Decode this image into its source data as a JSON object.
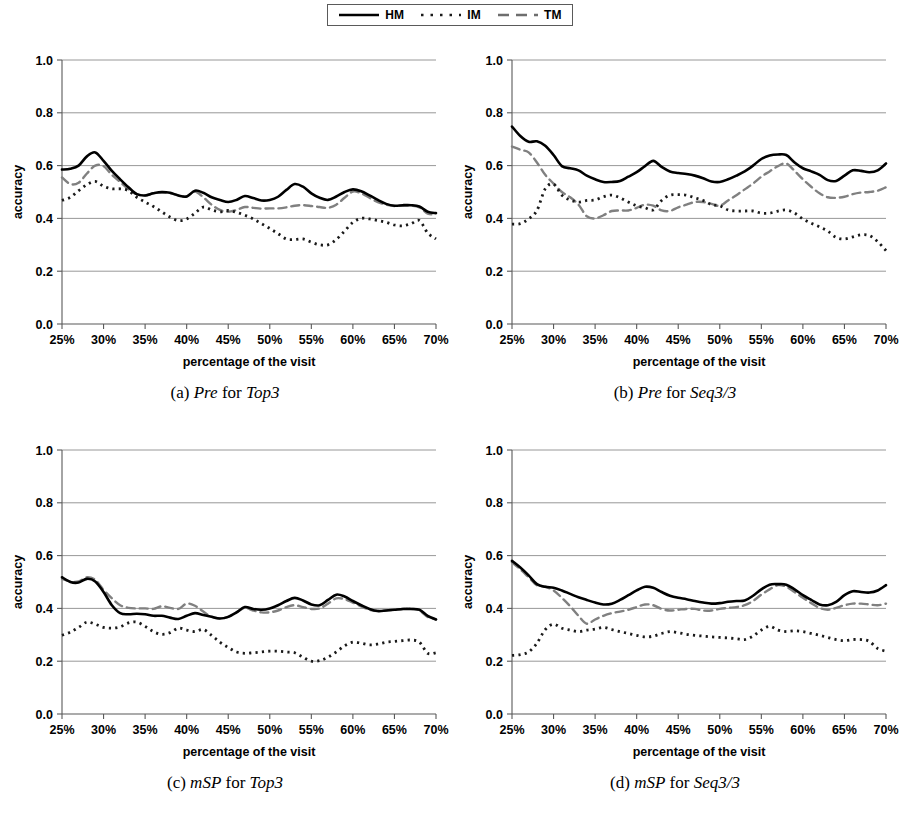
{
  "legend": {
    "entries": [
      {
        "label": "HM",
        "style": "solid"
      },
      {
        "label": "IM",
        "style": "dotted"
      },
      {
        "label": "TM",
        "style": "dashed"
      }
    ]
  },
  "colors": {
    "hm": "#000000",
    "im": "#1a1a1a",
    "tm": "#808080",
    "axis": "#595959",
    "grid": "#8c8c8c",
    "background": "#ffffff"
  },
  "axes": {
    "ylabel": "accuracy",
    "xlabel": "percentage of the visit",
    "yticks": [
      "0.0",
      "0.2",
      "0.4",
      "0.6",
      "0.8",
      "1.0"
    ],
    "xticks": [
      "25%",
      "30%",
      "35%",
      "40%",
      "45%",
      "50%",
      "55%",
      "60%",
      "65%",
      "70%"
    ],
    "ylim": [
      0.0,
      1.0
    ],
    "xlim": [
      25,
      70
    ],
    "grid": true,
    "legend_position": "top-center"
  },
  "captions": {
    "a": {
      "index": "(a)",
      "metric": "Pre",
      "joiner": "for",
      "dataset": "Top3"
    },
    "b": {
      "index": "(b)",
      "metric": "Pre",
      "joiner": "for",
      "dataset": "Seq3/3"
    },
    "c": {
      "index": "(c)",
      "metric": "mSP",
      "joiner": "for",
      "dataset": "Top3"
    },
    "d": {
      "index": "(d)",
      "metric": "mSP",
      "joiner": "for",
      "dataset": "Seq3/3"
    }
  },
  "chart_data": [
    {
      "id": "a",
      "type": "line",
      "title": "(a) Pre for Top3",
      "xlabel": "percentage of the visit",
      "ylabel": "accuracy",
      "xlim": [
        25,
        70
      ],
      "ylim": [
        0.0,
        1.0
      ],
      "grid": true,
      "legend": [
        "HM",
        "IM",
        "TM"
      ],
      "x": [
        25,
        26,
        27,
        28,
        29,
        30,
        31,
        32,
        33,
        34,
        35,
        36,
        37,
        38,
        39,
        40,
        41,
        42,
        43,
        44,
        45,
        46,
        47,
        48,
        49,
        50,
        51,
        52,
        53,
        54,
        55,
        56,
        57,
        58,
        59,
        60,
        61,
        62,
        63,
        64,
        65,
        66,
        67,
        68,
        69,
        70
      ],
      "series": [
        {
          "name": "HM",
          "style": "solid",
          "values": [
            0.585,
            0.588,
            0.6,
            0.635,
            0.65,
            0.618,
            0.58,
            0.548,
            0.518,
            0.492,
            0.487,
            0.495,
            0.5,
            0.497,
            0.487,
            0.483,
            0.505,
            0.497,
            0.48,
            0.47,
            0.462,
            0.47,
            0.485,
            0.477,
            0.468,
            0.47,
            0.482,
            0.508,
            0.53,
            0.52,
            0.495,
            0.478,
            0.47,
            0.483,
            0.5,
            0.51,
            0.503,
            0.487,
            0.47,
            0.455,
            0.448,
            0.45,
            0.45,
            0.445,
            0.425,
            0.42
          ]
        },
        {
          "name": "IM",
          "style": "dotted",
          "values": [
            0.468,
            0.48,
            0.505,
            0.528,
            0.54,
            0.522,
            0.512,
            0.512,
            0.505,
            0.48,
            0.462,
            0.445,
            0.425,
            0.405,
            0.392,
            0.398,
            0.42,
            0.443,
            0.432,
            0.425,
            0.43,
            0.423,
            0.412,
            0.398,
            0.38,
            0.362,
            0.342,
            0.322,
            0.32,
            0.322,
            0.31,
            0.3,
            0.3,
            0.32,
            0.352,
            0.385,
            0.4,
            0.398,
            0.392,
            0.385,
            0.375,
            0.372,
            0.38,
            0.392,
            0.345,
            0.322
          ]
        },
        {
          "name": "TM",
          "style": "dashed",
          "values": [
            0.555,
            0.53,
            0.535,
            0.57,
            0.6,
            0.598,
            0.565,
            0.538,
            0.51,
            0.492,
            0.487,
            0.495,
            0.497,
            0.495,
            0.487,
            0.483,
            0.502,
            0.48,
            0.452,
            0.432,
            0.425,
            0.432,
            0.443,
            0.44,
            0.437,
            0.438,
            0.438,
            0.442,
            0.448,
            0.45,
            0.447,
            0.443,
            0.44,
            0.452,
            0.478,
            0.502,
            0.495,
            0.478,
            0.462,
            0.452,
            0.447,
            0.448,
            0.448,
            0.442,
            0.418,
            0.415
          ]
        }
      ]
    },
    {
      "id": "b",
      "type": "line",
      "title": "(b) Pre for Seq3/3",
      "xlabel": "percentage of the visit",
      "ylabel": "accuracy",
      "xlim": [
        25,
        70
      ],
      "ylim": [
        0.0,
        1.0
      ],
      "grid": true,
      "legend": [
        "HM",
        "IM",
        "TM"
      ],
      "x": [
        25,
        26,
        27,
        28,
        29,
        30,
        31,
        32,
        33,
        34,
        35,
        36,
        37,
        38,
        39,
        40,
        41,
        42,
        43,
        44,
        45,
        46,
        47,
        48,
        49,
        50,
        51,
        52,
        53,
        54,
        55,
        56,
        57,
        58,
        59,
        60,
        61,
        62,
        63,
        64,
        65,
        66,
        67,
        68,
        69,
        70
      ],
      "series": [
        {
          "name": "HM",
          "style": "solid",
          "values": [
            0.748,
            0.712,
            0.69,
            0.692,
            0.675,
            0.64,
            0.598,
            0.59,
            0.582,
            0.562,
            0.548,
            0.538,
            0.538,
            0.542,
            0.558,
            0.575,
            0.598,
            0.618,
            0.595,
            0.578,
            0.572,
            0.568,
            0.562,
            0.552,
            0.54,
            0.538,
            0.548,
            0.562,
            0.578,
            0.6,
            0.625,
            0.638,
            0.642,
            0.64,
            0.612,
            0.59,
            0.578,
            0.565,
            0.545,
            0.542,
            0.562,
            0.582,
            0.58,
            0.575,
            0.582,
            0.608
          ]
        },
        {
          "name": "IM",
          "style": "dotted",
          "values": [
            0.378,
            0.38,
            0.398,
            0.43,
            0.512,
            0.53,
            0.488,
            0.47,
            0.462,
            0.468,
            0.47,
            0.482,
            0.488,
            0.478,
            0.462,
            0.448,
            0.44,
            0.432,
            0.468,
            0.488,
            0.49,
            0.488,
            0.478,
            0.468,
            0.452,
            0.448,
            0.432,
            0.428,
            0.428,
            0.428,
            0.42,
            0.42,
            0.428,
            0.432,
            0.42,
            0.398,
            0.382,
            0.368,
            0.352,
            0.328,
            0.322,
            0.33,
            0.338,
            0.335,
            0.312,
            0.278
          ]
        },
        {
          "name": "TM",
          "style": "dashed",
          "values": [
            0.672,
            0.66,
            0.65,
            0.612,
            0.565,
            0.532,
            0.5,
            0.48,
            0.452,
            0.408,
            0.4,
            0.412,
            0.428,
            0.43,
            0.43,
            0.44,
            0.452,
            0.448,
            0.43,
            0.428,
            0.442,
            0.452,
            0.462,
            0.462,
            0.455,
            0.448,
            0.468,
            0.488,
            0.51,
            0.532,
            0.558,
            0.578,
            0.598,
            0.608,
            0.58,
            0.548,
            0.52,
            0.495,
            0.48,
            0.478,
            0.482,
            0.492,
            0.498,
            0.5,
            0.505,
            0.518
          ]
        }
      ]
    },
    {
      "id": "c",
      "type": "line",
      "title": "(c) mSP for Top3",
      "xlabel": "percentage of the visit",
      "ylabel": "accuracy",
      "xlim": [
        25,
        70
      ],
      "ylim": [
        0.0,
        1.0
      ],
      "grid": true,
      "legend": [
        "HM",
        "IM",
        "TM"
      ],
      "x": [
        25,
        26,
        27,
        28,
        29,
        30,
        31,
        32,
        33,
        34,
        35,
        36,
        37,
        38,
        39,
        40,
        41,
        42,
        43,
        44,
        45,
        46,
        47,
        48,
        49,
        50,
        51,
        52,
        53,
        54,
        55,
        56,
        57,
        58,
        59,
        60,
        61,
        62,
        63,
        64,
        65,
        66,
        67,
        68,
        69,
        70
      ],
      "series": [
        {
          "name": "HM",
          "style": "solid",
          "values": [
            0.518,
            0.5,
            0.498,
            0.512,
            0.502,
            0.462,
            0.412,
            0.382,
            0.378,
            0.38,
            0.378,
            0.372,
            0.372,
            0.365,
            0.36,
            0.372,
            0.382,
            0.375,
            0.368,
            0.362,
            0.368,
            0.385,
            0.405,
            0.398,
            0.395,
            0.4,
            0.412,
            0.428,
            0.44,
            0.43,
            0.415,
            0.412,
            0.432,
            0.452,
            0.445,
            0.428,
            0.412,
            0.398,
            0.39,
            0.392,
            0.395,
            0.398,
            0.398,
            0.395,
            0.372,
            0.358
          ]
        },
        {
          "name": "IM",
          "style": "dotted",
          "values": [
            0.298,
            0.31,
            0.328,
            0.348,
            0.34,
            0.328,
            0.325,
            0.33,
            0.345,
            0.348,
            0.332,
            0.312,
            0.302,
            0.308,
            0.325,
            0.318,
            0.312,
            0.32,
            0.298,
            0.272,
            0.252,
            0.235,
            0.23,
            0.232,
            0.235,
            0.238,
            0.238,
            0.235,
            0.232,
            0.215,
            0.2,
            0.202,
            0.215,
            0.235,
            0.258,
            0.272,
            0.268,
            0.262,
            0.265,
            0.272,
            0.275,
            0.278,
            0.28,
            0.272,
            0.23,
            0.232
          ]
        },
        {
          "name": "TM",
          "style": "dashed",
          "values": [
            0.512,
            0.502,
            0.502,
            0.518,
            0.508,
            0.47,
            0.438,
            0.412,
            0.402,
            0.4,
            0.4,
            0.398,
            0.408,
            0.402,
            0.398,
            0.418,
            0.41,
            0.388,
            0.368,
            0.362,
            0.368,
            0.385,
            0.402,
            0.392,
            0.385,
            0.385,
            0.392,
            0.405,
            0.412,
            0.405,
            0.398,
            0.4,
            0.418,
            0.438,
            0.435,
            0.422,
            0.408,
            0.395,
            0.39,
            0.392,
            0.395,
            0.398,
            0.398,
            0.392,
            0.368,
            0.358
          ]
        }
      ]
    },
    {
      "id": "d",
      "type": "line",
      "title": "(d) mSP for Seq3/3",
      "xlabel": "percentage of the visit",
      "ylabel": "accuracy",
      "xlim": [
        25,
        70
      ],
      "ylim": [
        0.0,
        1.0
      ],
      "grid": true,
      "legend": [
        "HM",
        "IM",
        "TM"
      ],
      "x": [
        25,
        26,
        27,
        28,
        29,
        30,
        31,
        32,
        33,
        34,
        35,
        36,
        37,
        38,
        39,
        40,
        41,
        42,
        43,
        44,
        45,
        46,
        47,
        48,
        49,
        50,
        51,
        52,
        53,
        54,
        55,
        56,
        57,
        58,
        59,
        60,
        61,
        62,
        63,
        64,
        65,
        66,
        67,
        68,
        69,
        70
      ],
      "series": [
        {
          "name": "HM",
          "style": "solid",
          "values": [
            0.58,
            0.555,
            0.525,
            0.492,
            0.482,
            0.478,
            0.468,
            0.455,
            0.442,
            0.432,
            0.422,
            0.415,
            0.418,
            0.432,
            0.45,
            0.468,
            0.482,
            0.478,
            0.462,
            0.448,
            0.44,
            0.435,
            0.428,
            0.422,
            0.418,
            0.42,
            0.425,
            0.428,
            0.43,
            0.448,
            0.472,
            0.49,
            0.492,
            0.49,
            0.472,
            0.45,
            0.432,
            0.415,
            0.412,
            0.425,
            0.45,
            0.465,
            0.462,
            0.46,
            0.468,
            0.488
          ]
        },
        {
          "name": "IM",
          "style": "dotted",
          "values": [
            0.222,
            0.225,
            0.235,
            0.268,
            0.32,
            0.34,
            0.325,
            0.318,
            0.312,
            0.318,
            0.322,
            0.328,
            0.32,
            0.312,
            0.305,
            0.298,
            0.292,
            0.295,
            0.305,
            0.312,
            0.308,
            0.302,
            0.298,
            0.295,
            0.292,
            0.29,
            0.288,
            0.285,
            0.282,
            0.295,
            0.318,
            0.332,
            0.318,
            0.312,
            0.315,
            0.312,
            0.305,
            0.298,
            0.29,
            0.282,
            0.278,
            0.282,
            0.282,
            0.275,
            0.248,
            0.238
          ]
        },
        {
          "name": "TM",
          "style": "dashed",
          "values": [
            0.575,
            0.548,
            0.518,
            0.488,
            0.482,
            0.468,
            0.44,
            0.408,
            0.372,
            0.342,
            0.358,
            0.372,
            0.382,
            0.388,
            0.395,
            0.405,
            0.415,
            0.412,
            0.398,
            0.392,
            0.395,
            0.398,
            0.398,
            0.392,
            0.392,
            0.398,
            0.402,
            0.405,
            0.412,
            0.428,
            0.452,
            0.472,
            0.488,
            0.482,
            0.462,
            0.44,
            0.42,
            0.402,
            0.395,
            0.402,
            0.412,
            0.418,
            0.418,
            0.415,
            0.412,
            0.418
          ]
        }
      ]
    }
  ]
}
